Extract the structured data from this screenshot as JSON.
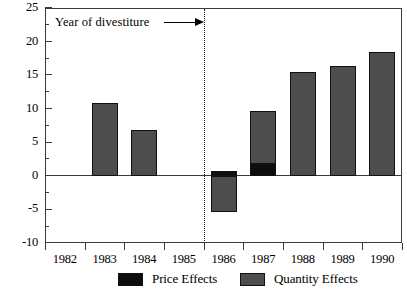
{
  "chart_data": {
    "type": "bar",
    "title": "",
    "subtitle": "",
    "xlabel": "",
    "ylabel": "",
    "stacked": true,
    "grid": false,
    "categories": [
      "1982",
      "1983",
      "1984",
      "1985",
      "1986",
      "1987",
      "1988",
      "1989",
      "1990"
    ],
    "series": [
      {
        "name": "Price Effects",
        "color": "#0d0d0d",
        "values": [
          0,
          0,
          0,
          0,
          0.7,
          1.8,
          0,
          0,
          0
        ]
      },
      {
        "name": "Quantity Effects",
        "color": "#4d4d4d",
        "values": [
          0,
          10.9,
          6.9,
          0,
          -5.4,
          7.9,
          15.5,
          16.4,
          18.4
        ]
      }
    ],
    "bar_totals": [
      0,
      10.9,
      6.9,
      0,
      -5.4,
      9.7,
      15.5,
      16.4,
      18.4
    ],
    "ylim": [
      -10,
      25
    ],
    "ytick_labels": [
      "25",
      "20",
      "15",
      "10",
      "5",
      "0",
      "-5",
      "-10"
    ],
    "ytick_values": [
      25,
      20,
      15,
      10,
      5,
      0,
      -5,
      -10
    ],
    "yminor_values": [
      22.5,
      17.5,
      12.5,
      7.5,
      2.5,
      -2.5,
      -7.5
    ],
    "xtick_labels": [
      "1982",
      "1983",
      "1984",
      "1985",
      "1986",
      "1987",
      "1988",
      "1989",
      "1990"
    ],
    "legend": {
      "position": "bottom",
      "entries": [
        {
          "label": "Price Effects",
          "color": "#0d0d0d"
        },
        {
          "label": "Quantity Effects",
          "color": "#4d4d4d"
        }
      ]
    },
    "annotations": [
      {
        "text": "Year of divestiture",
        "arrow": "right",
        "points_to_x": 1985.5,
        "marker": "dotted-vertical-line"
      }
    ]
  },
  "annotation": {
    "divestiture_label": "Year of divestiture"
  },
  "legend": {
    "price_label": "Price Effects",
    "quantity_label": "Quantity Effects"
  },
  "axis": {
    "y": {
      "labels": [
        "25",
        "20",
        "15",
        "10",
        "5",
        "0",
        "-5",
        "-10"
      ]
    },
    "x": {
      "labels": [
        "1982",
        "1983",
        "1984",
        "1985",
        "1986",
        "1987",
        "1988",
        "1989",
        "1990"
      ]
    }
  }
}
